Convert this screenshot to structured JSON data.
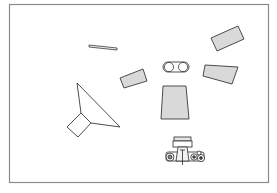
{
  "diagram": {
    "colors": {
      "background": "#ffffff",
      "frame": "#8a8a8a",
      "outline": "#3a3a3a",
      "panel_fill": "#d9d9d9"
    },
    "elements": [
      {
        "id": "reflector-strip",
        "label": "Thin reflector strip"
      },
      {
        "id": "softbox-left",
        "label": "Light panel (left)"
      },
      {
        "id": "subject",
        "label": "Subject (capsule)"
      },
      {
        "id": "background-panel",
        "label": "Center panel"
      },
      {
        "id": "softbox-right-top",
        "label": "Light panel (top right)"
      },
      {
        "id": "softbox-right-mid",
        "label": "Light panel (right)"
      },
      {
        "id": "umbrella-reflector",
        "label": "Umbrella / cone reflector with lamp head"
      },
      {
        "id": "camera",
        "label": "Camera (top view)"
      }
    ]
  }
}
